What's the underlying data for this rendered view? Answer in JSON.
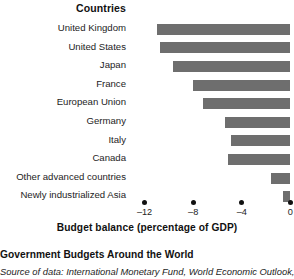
{
  "header": {
    "column_header": "Countries"
  },
  "caption": {
    "title": "Government Budgets Around the World",
    "source": "Source of data: International Monetary Fund, World Economic Outlook,"
  },
  "chart_data": {
    "type": "bar",
    "orientation": "horizontal",
    "title": "Government Budgets Around the World",
    "xlabel": "Budget balance (percentage of GDP)",
    "ylabel": "Countries",
    "xlim": [
      -13.2,
      0.3
    ],
    "xticks": [
      -12,
      -8,
      -4,
      0
    ],
    "xticklabels": [
      "–12",
      "–8",
      "–4",
      "0"
    ],
    "grid": false,
    "legend": null,
    "bar_color": "#6e6e6e",
    "categories": [
      "United Kingdom",
      "United States",
      "Japan",
      "France",
      "European Union",
      "Germany",
      "Italy",
      "Canada",
      "Other advanced countries",
      "Newly industrialized Asia"
    ],
    "values": [
      -11.0,
      -10.7,
      -9.7,
      -8.0,
      -7.2,
      -5.4,
      -4.9,
      -5.1,
      -1.6,
      -0.6
    ]
  }
}
